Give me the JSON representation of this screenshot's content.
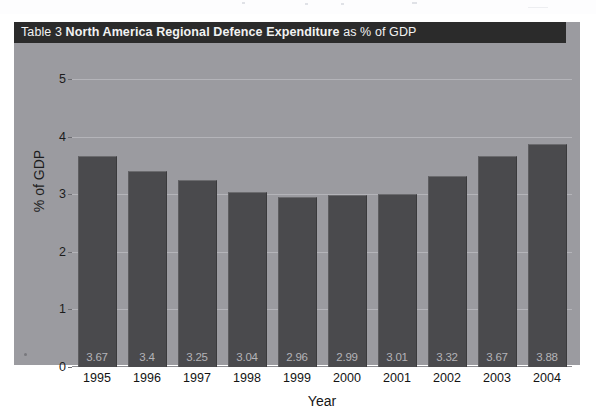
{
  "figure": {
    "table_label": "Table 3",
    "title_bold": "North America Regional Defence Expenditure",
    "title_suffix": "as % of GDP",
    "colors": {
      "title_bar_bg": "#2b2b2b",
      "title_text": "#f2f2f2",
      "figure_bg": "#9b9ba0",
      "bar_fill": "#4a4a4d",
      "gridline": "#b9b9bd",
      "value_label": "#b4b4b8",
      "axis_text": "#1c1c1c"
    }
  },
  "chart_data": {
    "type": "bar",
    "title": "Table 3 North America Regional Defence Expenditure as % of GDP",
    "xlabel": "Year",
    "ylabel": "% of GDP",
    "categories": [
      "1995",
      "1996",
      "1997",
      "1998",
      "1999",
      "2000",
      "2001",
      "2002",
      "2003",
      "2004"
    ],
    "values": [
      3.67,
      3.4,
      3.25,
      3.04,
      2.96,
      2.99,
      3.01,
      3.32,
      3.67,
      3.88
    ],
    "data_labels": [
      "3.67",
      "3.4",
      "3.25",
      "3.04",
      "2.96",
      "2.99",
      "3.01",
      "3.32",
      "3.67",
      "3.88"
    ],
    "ylim": [
      0,
      5
    ],
    "yticks": [
      0,
      1,
      2,
      3,
      4,
      5
    ],
    "ytick_labels": [
      "0",
      "1",
      "2",
      "3",
      "4",
      "5"
    ],
    "grid": true,
    "grid_axis": "y",
    "legend": false,
    "series": [
      {
        "name": "North America defence expenditure as % of GDP",
        "values": [
          3.67,
          3.4,
          3.25,
          3.04,
          2.96,
          2.99,
          3.01,
          3.32,
          3.67,
          3.88
        ]
      }
    ]
  }
}
